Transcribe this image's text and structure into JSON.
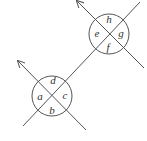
{
  "diagram": {
    "type": "intersecting-lines-angle-labels",
    "intersections": [
      {
        "name": "upper",
        "labels": {
          "top": "h",
          "left": "e",
          "right": "g",
          "bottom": "f"
        }
      },
      {
        "name": "lower",
        "labels": {
          "top": "d",
          "left": "a",
          "right": "c",
          "bottom": "b"
        }
      }
    ],
    "colors": {
      "stroke": "#555555",
      "text": "#333333",
      "background": "#ffffff"
    }
  }
}
